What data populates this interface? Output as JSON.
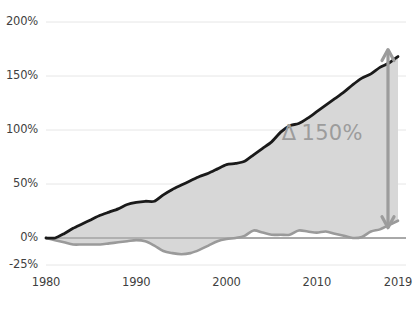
{
  "chart_data": {
    "type": "area",
    "title": "",
    "subtitle": "",
    "xlabel": "",
    "ylabel": "",
    "xlim": [
      1980,
      2019
    ],
    "ylim": [
      -25,
      200
    ],
    "grid": true,
    "grid_axis": "y",
    "legend": "none",
    "y_ticks": [
      200,
      150,
      100,
      50,
      0,
      -25
    ],
    "y_tick_labels": [
      "200%",
      "150%",
      "100%",
      "50%",
      "0%",
      "-25%"
    ],
    "x_ticks": [
      1980,
      1990,
      2000,
      2010,
      2019
    ],
    "x_tick_labels": [
      "1980",
      "1990",
      "2000",
      "2010",
      "2019"
    ],
    "colors": {
      "upper_line": "#1a1a1a",
      "lower_line": "#9a9a9a",
      "fill": "#d5d5d5",
      "gridline": "#e6e6e6",
      "zero_line": "#8c8c8c",
      "annotation": "#9c9c9c",
      "tick_text": "#3f3f41",
      "background": "#ffffff"
    },
    "annotations": [
      {
        "name": "delta-annotation",
        "symbol": "Δ",
        "text": "150%",
        "value": 150,
        "x": 2013,
        "y": 95
      },
      {
        "name": "delta-arrow",
        "type": "double-headed-vertical-arrow",
        "x": 2019,
        "y_from": 16,
        "y_to": 168
      }
    ],
    "x": [
      1980,
      1981,
      1982,
      1983,
      1984,
      1985,
      1986,
      1987,
      1988,
      1989,
      1990,
      1991,
      1992,
      1993,
      1994,
      1995,
      1996,
      1997,
      1998,
      1999,
      2000,
      2001,
      2002,
      2003,
      2004,
      2005,
      2006,
      2007,
      2008,
      2009,
      2010,
      2011,
      2012,
      2013,
      2014,
      2015,
      2016,
      2017,
      2018,
      2019
    ],
    "series": [
      {
        "name": "upper",
        "label": "Upper series",
        "color": "#1a1a1a",
        "values": [
          0,
          0,
          4,
          9,
          13,
          17,
          21,
          24,
          27,
          31,
          33,
          34,
          34,
          40,
          45,
          49,
          53,
          57,
          60,
          64,
          68,
          69,
          71,
          77,
          83,
          89,
          98,
          104,
          106,
          111,
          117,
          123,
          129,
          135,
          142,
          148,
          152,
          158,
          162,
          168
        ]
      },
      {
        "name": "lower",
        "label": "Lower series",
        "color": "#9a9a9a",
        "values": [
          0,
          -2,
          -4,
          -6,
          -6,
          -6,
          -6,
          -5,
          -4,
          -3,
          -2,
          -3,
          -7,
          -12,
          -14,
          -15,
          -14,
          -11,
          -7,
          -3,
          -1,
          0,
          2,
          7,
          5,
          3,
          3,
          3,
          7,
          6,
          5,
          6,
          4,
          2,
          0,
          1,
          6,
          8,
          12,
          16
        ]
      }
    ]
  }
}
